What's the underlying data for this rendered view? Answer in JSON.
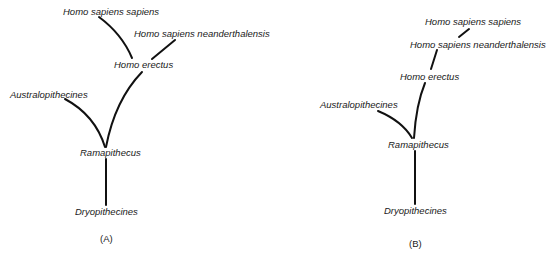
{
  "figure": {
    "panels": [
      {
        "id": "A",
        "caption": "(A)",
        "nodes": {
          "homo_sapiens_sapiens": "Homo sapiens sapiens",
          "homo_sapiens_neanderthalensis": "Homo sapiens neanderthalensis",
          "homo_erectus": "Homo erectus",
          "australopithecines": "Australopithecines",
          "ramapithecus": "Ramapithecus",
          "dryopithecines": "Dryopithecines"
        },
        "edges": [
          [
            "Dryopithecines",
            "Ramapithecus"
          ],
          [
            "Ramapithecus",
            "Australopithecines"
          ],
          [
            "Ramapithecus",
            "Homo erectus"
          ],
          [
            "Homo erectus",
            "Homo sapiens sapiens"
          ],
          [
            "Homo erectus",
            "Homo sapiens neanderthalensis"
          ]
        ]
      },
      {
        "id": "B",
        "caption": "(B)",
        "nodes": {
          "homo_sapiens_sapiens": "Homo sapiens sapiens",
          "homo_sapiens_neanderthalensis": "Homo sapiens neanderthalensis",
          "homo_erectus": "Homo erectus",
          "australopithecines": "Australopithecines",
          "ramapithecus": "Ramapithecus",
          "dryopithecines": "Dryopithecines"
        },
        "edges": [
          [
            "Dryopithecines",
            "Ramapithecus"
          ],
          [
            "Ramapithecus",
            "Australopithecines"
          ],
          [
            "Ramapithecus",
            "Homo erectus"
          ],
          [
            "Homo erectus",
            "Homo sapiens neanderthalensis"
          ],
          [
            "Homo sapiens neanderthalensis",
            "Homo sapiens sapiens"
          ]
        ]
      }
    ]
  }
}
